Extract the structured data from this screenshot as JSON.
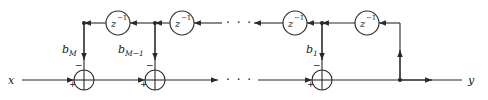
{
  "diagram": {
    "input_label": "x",
    "output_label": "y",
    "ellipsis": "· · ·",
    "plus_sign": "+",
    "minus_sign": "−",
    "colors": {
      "wire": "#2a2a2a",
      "background": "#ffffff",
      "text": "#1a1a1a"
    },
    "delay_elements": [
      {
        "id": "delay-1",
        "base": "z",
        "exponent": "−1",
        "cx": 118,
        "cy": 23,
        "r": 12
      },
      {
        "id": "delay-2",
        "base": "z",
        "exponent": "−1",
        "cx": 182,
        "cy": 23,
        "r": 12
      },
      {
        "id": "delay-3",
        "base": "z",
        "exponent": "−1",
        "cx": 295,
        "cy": 23,
        "r": 12
      },
      {
        "id": "delay-4",
        "base": "z",
        "exponent": "−1",
        "cx": 367,
        "cy": 23,
        "r": 12
      }
    ],
    "coefficients": [
      {
        "id": "coef-bM",
        "base": "b",
        "subscript": "M",
        "x": 62,
        "y": 53
      },
      {
        "id": "coef-bM-1",
        "base": "b",
        "subscript": "M−1",
        "x": 118,
        "y": 53
      },
      {
        "id": "coef-b1",
        "base": "b",
        "subscript": "1",
        "x": 306,
        "y": 53
      }
    ],
    "adders": [
      {
        "id": "adder-1",
        "cx": 84,
        "cy": 80,
        "r": 10
      },
      {
        "id": "adder-2",
        "cx": 155,
        "cy": 80,
        "r": 10
      },
      {
        "id": "adder-3",
        "cx": 322,
        "cy": 80,
        "r": 10
      }
    ],
    "rails": {
      "top_y": 23,
      "bottom_y": 80,
      "left_x": 22,
      "right_x": 462,
      "feedback_x": 400
    }
  }
}
